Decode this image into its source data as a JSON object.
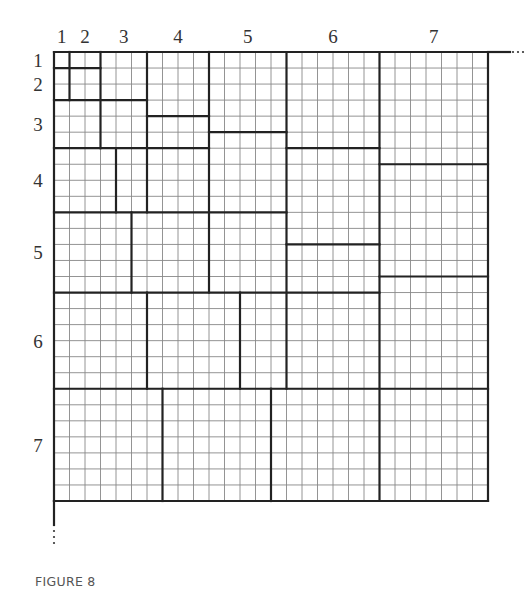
{
  "caption": "FIGURE 8",
  "diagram": {
    "grid_cells": 28,
    "band_boundaries": [
      0,
      1,
      3,
      6,
      10,
      15,
      21,
      28
    ],
    "column_labels": [
      "1",
      "2",
      "3",
      "4",
      "5",
      "6",
      "7"
    ],
    "row_labels": [
      "1",
      "2",
      "3",
      "4",
      "5",
      "6",
      "7"
    ],
    "continuation_marks": {
      "right": "...",
      "bottom": "⋮"
    },
    "thick_segments": {
      "vertical": [
        [
          1,
          0,
          3
        ],
        [
          3,
          0,
          6
        ],
        [
          6,
          0,
          10
        ],
        [
          4,
          6,
          10
        ],
        [
          10,
          0,
          15
        ],
        [
          5,
          10,
          15
        ],
        [
          15,
          0,
          21
        ],
        [
          6,
          15,
          21
        ],
        [
          12,
          15,
          21
        ],
        [
          21,
          0,
          28
        ],
        [
          7,
          21,
          28
        ],
        [
          14,
          21,
          28
        ],
        [
          28,
          0,
          28
        ],
        [
          0,
          0,
          28
        ]
      ],
      "horizontal": [
        [
          1,
          0,
          3
        ],
        [
          3,
          0,
          6
        ],
        [
          4,
          6,
          10
        ],
        [
          6,
          0,
          10
        ],
        [
          5,
          10,
          15
        ],
        [
          10,
          0,
          15
        ],
        [
          6,
          15,
          21
        ],
        [
          12,
          15,
          21
        ],
        [
          15,
          0,
          21
        ],
        [
          7,
          21,
          28
        ],
        [
          14,
          21,
          28
        ],
        [
          21,
          0,
          28
        ],
        [
          28,
          0,
          28
        ],
        [
          0,
          0,
          28
        ]
      ]
    }
  }
}
